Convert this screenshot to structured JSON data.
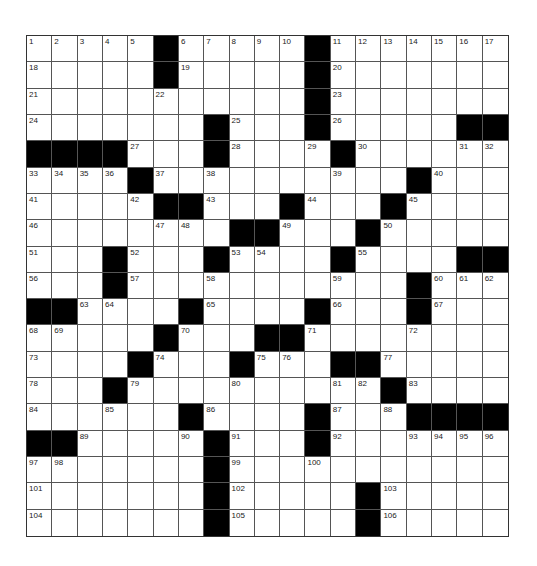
{
  "puzzle": {
    "rows": 19,
    "cols": 19,
    "grid": [
      ".....#.....#.......",
      ".....#.....#.......",
      "...........#.......",
      ".......#...#.....##",
      "####...#....#......",
      "....#..........#...",
      ".....##...#...#....",
      "........##...#.....",
      "...#...#....#....##",
      "...#...........#...",
      "##....#....#...#...",
      ".....#...##........",
      "....#...#...##.....",
      "...#..........#....",
      "......#....#...####",
      "##.....#...#.......",
      ".......#...........",
      ".......#.....#.....",
      ".......#.....#....."
    ],
    "numbers": {
      "0,0": "1",
      "0,1": "2",
      "0,2": "3",
      "0,3": "4",
      "0,4": "5",
      "0,6": "6",
      "0,7": "7",
      "0,8": "8",
      "0,9": "9",
      "0,10": "10",
      "0,12": "11",
      "0,13": "12",
      "0,14": "13",
      "0,15": "14",
      "0,16": "15",
      "0,17": "16",
      "0,18": "17",
      "1,0": "18",
      "1,6": "19",
      "1,12": "20",
      "2,0": "21",
      "2,5": "22",
      "2,12": "23",
      "3,0": "24",
      "3,8": "25",
      "3,12": "26",
      "4,4": "27",
      "4,8": "28",
      "4,11": "29",
      "4,13": "30",
      "4,17": "31",
      "4,18": "32",
      "5,0": "33",
      "5,1": "34",
      "5,2": "35",
      "5,3": "36",
      "5,5": "37",
      "5,7": "38",
      "5,12": "39",
      "5,16": "40",
      "6,0": "41",
      "6,4": "42",
      "6,7": "43",
      "6,11": "44",
      "6,15": "45",
      "7,0": "46",
      "7,5": "47",
      "7,6": "48",
      "7,10": "49",
      "7,14": "50",
      "8,0": "51",
      "8,4": "52",
      "8,8": "53",
      "8,9": "54",
      "8,13": "55",
      "9,0": "56",
      "9,4": "57",
      "9,7": "58",
      "9,12": "59",
      "9,16": "60",
      "9,17": "61",
      "9,18": "62",
      "10,2": "63",
      "10,3": "64",
      "10,7": "65",
      "10,12": "66",
      "10,16": "67",
      "11,0": "68",
      "11,1": "69",
      "11,6": "70",
      "11,11": "71",
      "11,15": "72",
      "12,0": "73",
      "12,5": "74",
      "12,9": "75",
      "12,10": "76",
      "12,14": "77",
      "13,0": "78",
      "13,4": "79",
      "13,8": "80",
      "13,12": "81",
      "13,13": "82",
      "13,15": "83",
      "14,0": "84",
      "14,3": "85",
      "14,7": "86",
      "14,12": "87",
      "14,14": "88",
      "15,2": "89",
      "15,6": "90",
      "15,8": "91",
      "15,12": "92",
      "15,15": "93",
      "15,16": "94",
      "15,17": "95",
      "15,18": "96",
      "16,0": "97",
      "16,1": "98",
      "16,8": "99",
      "16,11": "100",
      "17,0": "101",
      "17,8": "102",
      "17,14": "103",
      "18,0": "104",
      "18,8": "105",
      "18,14": "106"
    },
    "colors": {
      "block": "#000000",
      "cell": "#ffffff",
      "line": "#555555"
    }
  }
}
